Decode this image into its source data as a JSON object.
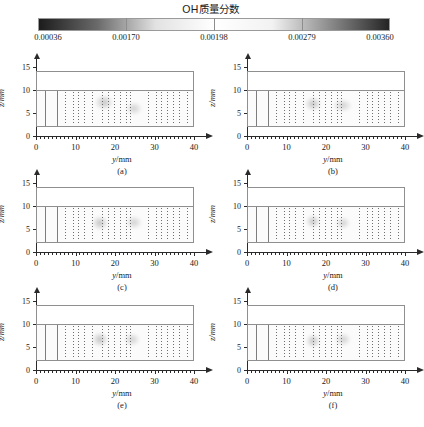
{
  "figure": {
    "colorbar": {
      "title": "OH质量分数",
      "orientation": "horizontal",
      "colormap": "grayscale-dark-light-dark",
      "tick_labels": [
        "0.00036",
        "0.00170",
        "0.00198",
        "0.00279",
        "0.00360"
      ],
      "tick_values": [
        0.00036,
        0.0017,
        0.00198,
        0.00279,
        0.0036
      ],
      "vmin": 0.00036,
      "vmax": 0.0036
    },
    "axes": {
      "xlabel": "y/mm",
      "xlabel_var": "y",
      "xlabel_unit": "/mm",
      "ylabel": "z/mm",
      "ylabel_var": "z",
      "ylabel_unit": "/mm",
      "x_ticks": [
        "0",
        "10",
        "20",
        "30",
        "40"
      ],
      "x_tick_values": [
        0,
        10,
        20,
        30,
        40
      ],
      "xlim": [
        0,
        41
      ],
      "y_ticks": [
        "0",
        "5",
        "10",
        "15"
      ],
      "y_tick_values": [
        0,
        5,
        10,
        15
      ],
      "ylim": [
        0,
        16
      ]
    },
    "panels": [
      {
        "label": "(a)",
        "name": "panel-a"
      },
      {
        "label": "(b)",
        "name": "panel-b"
      },
      {
        "label": "(c)",
        "name": "panel-c"
      },
      {
        "label": "(d)",
        "name": "panel-d"
      },
      {
        "label": "(e)",
        "name": "panel-e"
      },
      {
        "label": "(f)",
        "name": "panel-f"
      }
    ]
  },
  "chart_data": {
    "type": "heatmap",
    "title": "OH质量分数",
    "xlabel": "y/mm",
    "ylabel": "z/mm",
    "xlim": [
      0,
      41
    ],
    "ylim": [
      0,
      16
    ],
    "x_tick_labels": [
      "0",
      "10",
      "20",
      "30",
      "40"
    ],
    "y_tick_labels": [
      "0",
      "5",
      "10",
      "15"
    ],
    "grid": false,
    "legend_position": "top",
    "colorbar": {
      "label": "OH质量分数",
      "ticks": [
        0.00036,
        0.0017,
        0.00198,
        0.00279,
        0.0036
      ],
      "tick_labels": [
        "0.00036",
        "0.00170",
        "0.00198",
        "0.00279",
        "0.00360"
      ],
      "vmin": 0.00036,
      "vmax": 0.0036,
      "colors": [
        "#1c1c1c",
        "#6a6a6a",
        "#e2e2e2",
        "#ffffff",
        "#f2f2f2",
        "#8a8a8a",
        "#242424"
      ]
    },
    "domain": {
      "outer_rect": {
        "y0": 0.0,
        "y1": 40.0,
        "z0": 2.0,
        "z1": 14.0
      },
      "inner_rect": {
        "y0": 0.0,
        "y1": 40.0,
        "z0": 2.0,
        "z1": 10.0
      },
      "wall_lines_y": [
        2.0,
        5.0
      ],
      "mesh_lines_y": [
        7,
        9,
        10.5,
        12,
        14,
        16.5,
        18,
        19.5,
        21,
        22.5,
        23.5,
        28,
        30,
        31.5,
        33,
        34.5,
        36,
        38
      ]
    },
    "series": [
      {
        "name": "(a)",
        "panel": "a",
        "hot_spots": [
          {
            "y": 17.0,
            "z": 7.5,
            "value": 0.00279,
            "radius_y": 2.2,
            "radius_z": 1.6
          },
          {
            "y": 24.5,
            "z": 6.2,
            "value": 0.00198,
            "radius_y": 2.0,
            "radius_z": 1.4
          }
        ]
      },
      {
        "name": "(b)",
        "panel": "b",
        "hot_spots": [
          {
            "y": 16.5,
            "z": 7.2,
            "value": 0.00279,
            "radius_y": 2.0,
            "radius_z": 1.5
          },
          {
            "y": 24.0,
            "z": 6.8,
            "value": 0.00198,
            "radius_y": 2.4,
            "radius_z": 1.5
          }
        ]
      },
      {
        "name": "(c)",
        "panel": "c",
        "hot_spots": [
          {
            "y": 16.0,
            "z": 6.5,
            "value": 0.00279,
            "radius_y": 2.0,
            "radius_z": 1.5
          },
          {
            "y": 24.5,
            "z": 6.5,
            "value": 0.00198,
            "radius_y": 2.0,
            "radius_z": 1.4
          }
        ]
      },
      {
        "name": "(d)",
        "panel": "d",
        "hot_spots": [
          {
            "y": 16.5,
            "z": 6.8,
            "value": 0.00279,
            "radius_y": 1.8,
            "radius_z": 1.5
          },
          {
            "y": 24.0,
            "z": 6.5,
            "value": 0.00198,
            "radius_y": 1.8,
            "radius_z": 1.3
          }
        ]
      },
      {
        "name": "(e)",
        "panel": "e",
        "hot_spots": [
          {
            "y": 16.0,
            "z": 6.8,
            "value": 0.00279,
            "radius_y": 2.0,
            "radius_z": 1.6
          },
          {
            "y": 24.0,
            "z": 6.8,
            "value": 0.00198,
            "radius_y": 2.0,
            "radius_z": 1.4
          }
        ]
      },
      {
        "name": "(f)",
        "panel": "f",
        "hot_spots": [
          {
            "y": 16.5,
            "z": 6.5,
            "value": 0.00279,
            "radius_y": 1.8,
            "radius_z": 1.5
          },
          {
            "y": 24.0,
            "z": 6.8,
            "value": 0.00198,
            "radius_y": 2.0,
            "radius_z": 1.4
          }
        ]
      }
    ]
  }
}
